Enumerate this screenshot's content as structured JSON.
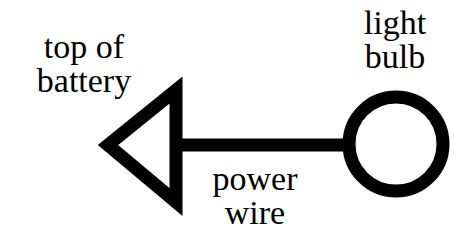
{
  "diagram": {
    "type": "circuit-schematic",
    "labels": {
      "battery": {
        "line1": "top of",
        "line2": "battery"
      },
      "bulb": {
        "line1": "light",
        "line2": "bulb"
      },
      "wire": {
        "line1": "power",
        "line2": "wire"
      }
    },
    "elements": [
      {
        "id": "battery-triangle",
        "shape": "triangle",
        "label": "top of battery"
      },
      {
        "id": "power-wire",
        "shape": "line",
        "label": "power wire"
      },
      {
        "id": "light-bulb-circle",
        "shape": "circle",
        "label": "light bulb"
      }
    ],
    "colors": {
      "stroke": "#000000",
      "background": "#ffffff"
    }
  }
}
